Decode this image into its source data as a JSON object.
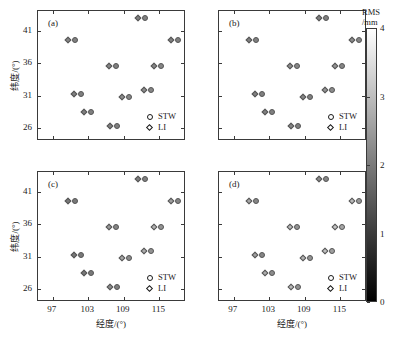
{
  "figure": {
    "type": "scatter-grid",
    "panel_tags": [
      "(a)",
      "(b)",
      "(c)",
      "(d)"
    ]
  },
  "axes": {
    "x": {
      "title": "经度/(°)",
      "ticks": [
        97,
        103,
        109,
        115
      ],
      "min": 94.5,
      "max": 119.5
    },
    "y": {
      "title": "纬度/(°)",
      "ticks": [
        26,
        31,
        36,
        41
      ],
      "min": 24.0,
      "max": 44.0
    }
  },
  "legend": {
    "items": [
      {
        "symbol": "circle",
        "label": "STW"
      },
      {
        "symbol": "diamond",
        "label": "LI"
      }
    ]
  },
  "colorbar": {
    "title_line1": "RMS",
    "title_line2": "/mm",
    "ticks": [
      0,
      1,
      2,
      3,
      4
    ],
    "min": 0,
    "max": 4,
    "low_color": "#000000",
    "high_color": "#ffffff"
  },
  "chart_data": {
    "type": "scatter",
    "title": "",
    "xlabel": "经度/(°)",
    "ylabel": "纬度/(°)",
    "xlim": [
      94.5,
      119.5
    ],
    "ylim": [
      24.0,
      44.0
    ],
    "grid": false,
    "legend_position": "bottom-right",
    "colorbar": {
      "label": "RMS /mm",
      "range": [
        0,
        4
      ],
      "colormap": "gray"
    },
    "panels": [
      {
        "tag": "(a)",
        "stations": [
          {
            "lon": 100.3,
            "lat": 39.5,
            "li_rms": 2.1,
            "stw_rms": 2.0
          },
          {
            "lon": 101.3,
            "lat": 31.2,
            "li_rms": 2.0,
            "stw_rms": 2.0
          },
          {
            "lon": 102.9,
            "lat": 28.5,
            "li_rms": 2.0,
            "stw_rms": 2.0
          },
          {
            "lon": 107.1,
            "lat": 35.5,
            "li_rms": 2.1,
            "stw_rms": 2.0
          },
          {
            "lon": 107.4,
            "lat": 26.3,
            "li_rms": 2.0,
            "stw_rms": 2.0
          },
          {
            "lon": 109.3,
            "lat": 30.8,
            "li_rms": 2.2,
            "stw_rms": 2.1
          },
          {
            "lon": 112.0,
            "lat": 43.0,
            "li_rms": 2.0,
            "stw_rms": 2.0
          },
          {
            "lon": 113.0,
            "lat": 31.9,
            "li_rms": 2.2,
            "stw_rms": 2.1
          },
          {
            "lon": 114.7,
            "lat": 35.6,
            "li_rms": 2.1,
            "stw_rms": 2.1
          },
          {
            "lon": 117.6,
            "lat": 39.5,
            "li_rms": 2.0,
            "stw_rms": 2.0
          }
        ]
      },
      {
        "tag": "(b)",
        "stations": [
          {
            "lon": 100.3,
            "lat": 39.5,
            "li_rms": 2.0,
            "stw_rms": 2.0
          },
          {
            "lon": 101.3,
            "lat": 31.2,
            "li_rms": 2.0,
            "stw_rms": 2.0
          },
          {
            "lon": 102.9,
            "lat": 28.5,
            "li_rms": 2.0,
            "stw_rms": 2.0
          },
          {
            "lon": 107.1,
            "lat": 35.5,
            "li_rms": 2.2,
            "stw_rms": 2.1
          },
          {
            "lon": 107.4,
            "lat": 26.3,
            "li_rms": 2.1,
            "stw_rms": 2.0
          },
          {
            "lon": 109.3,
            "lat": 30.8,
            "li_rms": 2.1,
            "stw_rms": 2.0
          },
          {
            "lon": 112.0,
            "lat": 43.0,
            "li_rms": 2.0,
            "stw_rms": 2.0
          },
          {
            "lon": 113.0,
            "lat": 31.9,
            "li_rms": 2.3,
            "stw_rms": 2.2
          },
          {
            "lon": 114.7,
            "lat": 35.6,
            "li_rms": 2.3,
            "stw_rms": 2.1
          },
          {
            "lon": 117.6,
            "lat": 39.5,
            "li_rms": 2.2,
            "stw_rms": 2.1
          }
        ]
      },
      {
        "tag": "(c)",
        "stations": [
          {
            "lon": 100.3,
            "lat": 39.5,
            "li_rms": 1.9,
            "stw_rms": 1.9
          },
          {
            "lon": 101.3,
            "lat": 31.2,
            "li_rms": 1.9,
            "stw_rms": 1.9
          },
          {
            "lon": 102.9,
            "lat": 28.5,
            "li_rms": 1.9,
            "stw_rms": 1.9
          },
          {
            "lon": 107.1,
            "lat": 35.5,
            "li_rms": 2.4,
            "stw_rms": 2.1
          },
          {
            "lon": 107.4,
            "lat": 26.3,
            "li_rms": 2.2,
            "stw_rms": 2.0
          },
          {
            "lon": 109.3,
            "lat": 30.8,
            "li_rms": 2.6,
            "stw_rms": 2.2
          },
          {
            "lon": 112.0,
            "lat": 43.0,
            "li_rms": 2.0,
            "stw_rms": 2.0
          },
          {
            "lon": 113.0,
            "lat": 31.9,
            "li_rms": 2.7,
            "stw_rms": 2.3
          },
          {
            "lon": 114.7,
            "lat": 35.6,
            "li_rms": 2.8,
            "stw_rms": 2.3
          },
          {
            "lon": 117.6,
            "lat": 39.5,
            "li_rms": 2.5,
            "stw_rms": 2.1
          }
        ]
      },
      {
        "tag": "(d)",
        "stations": [
          {
            "lon": 100.3,
            "lat": 39.5,
            "li_rms": 2.6,
            "stw_rms": 2.1
          },
          {
            "lon": 101.3,
            "lat": 31.2,
            "li_rms": 2.5,
            "stw_rms": 2.1
          },
          {
            "lon": 102.9,
            "lat": 28.5,
            "li_rms": 2.7,
            "stw_rms": 2.2
          },
          {
            "lon": 107.1,
            "lat": 35.5,
            "li_rms": 2.9,
            "stw_rms": 2.3
          },
          {
            "lon": 107.4,
            "lat": 26.3,
            "li_rms": 2.9,
            "stw_rms": 2.3
          },
          {
            "lon": 109.3,
            "lat": 30.8,
            "li_rms": 2.8,
            "stw_rms": 2.3
          },
          {
            "lon": 112.0,
            "lat": 43.0,
            "li_rms": 2.2,
            "stw_rms": 2.1
          },
          {
            "lon": 113.0,
            "lat": 31.9,
            "li_rms": 3.0,
            "stw_rms": 2.5
          },
          {
            "lon": 114.7,
            "lat": 35.6,
            "li_rms": 3.1,
            "stw_rms": 2.6
          },
          {
            "lon": 117.6,
            "lat": 39.5,
            "li_rms": 2.9,
            "stw_rms": 2.4
          }
        ]
      }
    ]
  }
}
